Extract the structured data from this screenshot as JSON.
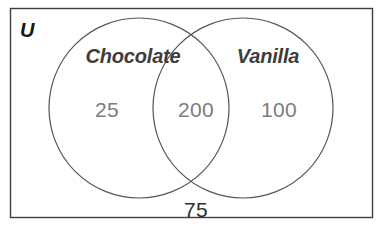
{
  "figure": {
    "type": "venn-diagram",
    "width": 384,
    "height": 232,
    "background_color": "#ffffff"
  },
  "universe": {
    "label": "U",
    "border_color": "#3f3f3f",
    "label_color": "#161616",
    "rect": {
      "x": 10,
      "y": 8,
      "width": 363,
      "height": 210
    }
  },
  "sets": [
    {
      "name": "chocolate",
      "label": "Chocolate",
      "label_color": "#3d3d3d",
      "circle": {
        "cx": 139,
        "cy": 108,
        "r": 90
      },
      "stroke_color": "#555555"
    },
    {
      "name": "vanilla",
      "label": "Vanilla",
      "label_color": "#3d3d3d",
      "circle": {
        "cx": 243,
        "cy": 108,
        "r": 90
      },
      "stroke_color": "#555555"
    }
  ],
  "regions": {
    "chocolate_only": {
      "value": "25",
      "color": "#7c7c7c"
    },
    "intersection": {
      "value": "200",
      "color": "#7c7c7c"
    },
    "vanilla_only": {
      "value": "100",
      "color": "#7c7c7c"
    },
    "outside_both": {
      "value": "75",
      "color": "#2e2e2e"
    }
  },
  "chart_data": {
    "type": "venn",
    "title": "",
    "universe_label": "U",
    "set_labels": [
      "Chocolate",
      "Vanilla"
    ],
    "categories": [
      "Chocolate only",
      "Both (Chocolate and Vanilla)",
      "Vanilla only",
      "Neither (outside both)"
    ],
    "values": [
      25,
      200,
      100,
      75
    ],
    "total": 400,
    "annotations": [
      "25",
      "200",
      "100",
      "75"
    ],
    "legend": "none",
    "grid": false
  }
}
